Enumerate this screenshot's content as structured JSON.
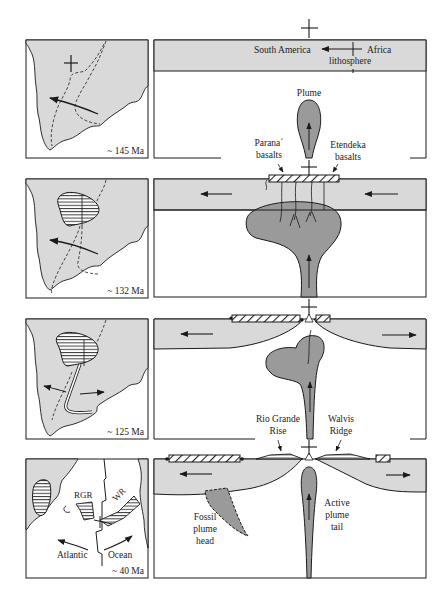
{
  "figure": {
    "rows": [
      {
        "id": "t145",
        "map": {
          "age_label": "~ 145 Ma"
        },
        "section": {
          "labels": {
            "south_america": "South America",
            "africa": "Africa",
            "lithosphere": "lithosphere",
            "plume": "Plume",
            "parana": "Parana´",
            "parana2": "basalts",
            "etendeka": "Etendeka",
            "etendeka2": "basalts"
          }
        }
      },
      {
        "id": "t132",
        "map": {
          "age_label": "~ 132 Ma"
        },
        "section": {
          "labels": {}
        }
      },
      {
        "id": "t125",
        "map": {
          "age_label": "~ 125 Ma"
        },
        "section": {
          "labels": {
            "rio_grande": "Rio Grande",
            "rio_grande2": "Rise",
            "walvis": "Walvis",
            "walvis2": "Ridge"
          }
        }
      },
      {
        "id": "t40",
        "map": {
          "age_label": "~ 40 Ma",
          "rgr": "RGR",
          "wr": "WR",
          "atlantic": "Atlantic",
          "ocean": "Ocean"
        },
        "section": {
          "labels": {
            "fossil": "Fossil",
            "fossil2": "plume",
            "fossil3": "head",
            "active": "Active",
            "active2": "plume",
            "active3": "tail"
          }
        }
      }
    ],
    "colors": {
      "lithosphere_fill": "#d9d9d9",
      "plume_fill": "#9a9a9a",
      "line": "#1a1a1a",
      "background": "#ffffff"
    }
  }
}
